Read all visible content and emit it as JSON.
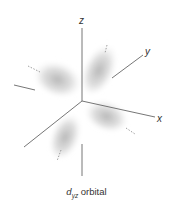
{
  "diagram": {
    "axes": [
      {
        "name": "x",
        "label": "x"
      },
      {
        "name": "y",
        "label": "y"
      },
      {
        "name": "z",
        "label": "z"
      }
    ],
    "lobes": 4,
    "colors": {
      "axis": "#555555",
      "lobe": "#b8b8b8",
      "label": "#333333"
    }
  },
  "caption": {
    "symbol": "d",
    "subscript": "yz",
    "text": " orbital"
  }
}
